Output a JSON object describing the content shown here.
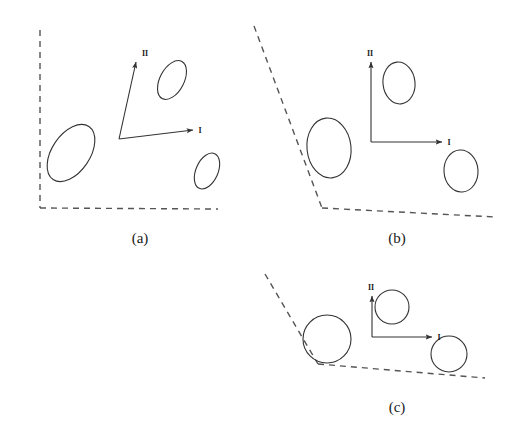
{
  "figure": {
    "stroke_color": "#333333",
    "dash_color": "#555555",
    "text_color": "#1a1a1a",
    "background": "#ffffff",
    "width": 513,
    "height": 429
  },
  "panels": [
    {
      "id": "a",
      "caption": "(a)",
      "caption_x": 140,
      "caption_y": 243,
      "axes": {
        "origin": {
          "x": 119,
          "y": 139
        },
        "axis_I": {
          "label": "I",
          "tip": {
            "x": 193,
            "y": 130
          },
          "label_x": 200,
          "label_y": 133
        },
        "axis_II": {
          "label": "II",
          "tip": {
            "x": 136,
            "y": 62
          },
          "label_x": 145,
          "label_y": 56
        }
      },
      "boundary": {
        "type": "corner-straight",
        "segments": [
          {
            "name": "left-wall",
            "x1": 40,
            "y1": 30,
            "x2": 40,
            "y2": 208
          },
          {
            "name": "bottom-wall",
            "x1": 40,
            "y1": 208,
            "x2": 218,
            "y2": 209
          }
        ]
      },
      "shapes": [
        {
          "name": "ellipse-left-large",
          "cx": 71,
          "cy": 153,
          "rx": 32,
          "ry": 19,
          "rotation": -56
        },
        {
          "name": "ellipse-upper",
          "cx": 172,
          "cy": 80,
          "rx": 21,
          "ry": 12,
          "rotation": -62
        },
        {
          "name": "ellipse-lower-right",
          "cx": 207,
          "cy": 171,
          "rx": 19,
          "ry": 11,
          "rotation": -66
        }
      ]
    },
    {
      "id": "b",
      "caption": "(b)",
      "caption_x": 397,
      "caption_y": 243,
      "axes": {
        "origin": {
          "x": 371,
          "y": 142
        },
        "axis_I": {
          "label": "I",
          "tip": {
            "x": 442,
            "y": 142
          },
          "label_x": 449,
          "label_y": 145
        },
        "axis_II": {
          "label": "II",
          "tip": {
            "x": 371,
            "y": 62
          },
          "label_x": 370,
          "label_y": 56
        }
      },
      "boundary": {
        "type": "obtuse-corner",
        "segments": [
          {
            "name": "slanted-wall",
            "x1": 254,
            "y1": 26,
            "x2": 322,
            "y2": 208
          },
          {
            "name": "bottom-wall",
            "x1": 322,
            "y1": 208,
            "x2": 495,
            "y2": 217
          }
        ]
      },
      "shapes": [
        {
          "name": "ellipse-left-large",
          "cx": 329,
          "cy": 148,
          "rx": 22,
          "ry": 30,
          "rotation": -6
        },
        {
          "name": "ellipse-upper",
          "cx": 399,
          "cy": 83,
          "rx": 16,
          "ry": 21,
          "rotation": -6
        },
        {
          "name": "ellipse-lower-right",
          "cx": 461,
          "cy": 171,
          "rx": 17,
          "ry": 21,
          "rotation": -4
        }
      ]
    },
    {
      "id": "c",
      "caption": "(c)",
      "caption_x": 397,
      "caption_y": 412,
      "axes": {
        "origin": {
          "x": 372,
          "y": 337
        },
        "axis_I": {
          "label": "I",
          "tip": {
            "x": 432,
            "y": 337
          },
          "label_x": 439,
          "label_y": 340
        },
        "axis_II": {
          "label": "II",
          "tip": {
            "x": 372,
            "y": 296
          },
          "label_x": 371,
          "label_y": 290
        },
        "axis_II_label": "II"
      },
      "boundary": {
        "type": "obtuse-corner",
        "segments": [
          {
            "name": "slanted-wall",
            "x1": 265,
            "y1": 274,
            "x2": 318,
            "y2": 364
          },
          {
            "name": "bottom-wall",
            "x1": 318,
            "y1": 364,
            "x2": 485,
            "y2": 378
          }
        ]
      },
      "shapes": [
        {
          "name": "circle-left-large",
          "cx": 327,
          "cy": 339,
          "rx": 24,
          "ry": 24,
          "rotation": 0
        },
        {
          "name": "circle-upper",
          "cx": 392,
          "cy": 307,
          "rx": 17,
          "ry": 17,
          "rotation": 0
        },
        {
          "name": "circle-lower-right",
          "cx": 449,
          "cy": 354,
          "rx": 18,
          "ry": 18,
          "rotation": 0
        }
      ]
    }
  ]
}
